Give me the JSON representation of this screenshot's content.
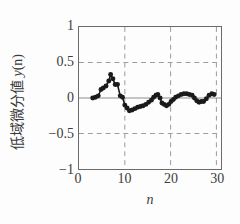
{
  "chart_data": {
    "type": "scatter",
    "title": "",
    "xlabel": "n",
    "ylabel": "低域微分値 y(n)",
    "ylabel_text": "低域微分値 ",
    "ylabel_italic": "y",
    "ylabel_paren": "(n)",
    "xlim": [
      0,
      31
    ],
    "ylim": [
      -1,
      1
    ],
    "xticks": [
      0,
      10,
      20,
      30
    ],
    "xtick_labels": [
      "0",
      "10",
      "20",
      "30"
    ],
    "yticks": [
      -1,
      -0.5,
      0,
      0.5,
      1
    ],
    "ytick_labels": [
      "−1",
      "−0.5",
      "0",
      "0.5",
      "1"
    ],
    "grid": true,
    "grid_style": "dashed",
    "zero_line": true,
    "legend": null,
    "marker": "filled-circle",
    "marker_color": "#1a1a1a",
    "line_color": "#1a1a1a",
    "x": [
      3,
      4,
      5,
      6,
      7,
      8,
      9,
      10,
      11,
      12,
      13,
      14,
      15,
      16,
      17,
      18,
      19,
      20,
      21,
      22,
      23,
      24,
      25,
      26,
      27,
      28,
      29
    ],
    "y": [
      0.0,
      0.02,
      0.13,
      0.17,
      0.33,
      0.2,
      0.02,
      -0.12,
      -0.18,
      -0.14,
      -0.11,
      -0.08,
      -0.05,
      0.02,
      0.05,
      -0.08,
      -0.11,
      -0.05,
      0.02,
      0.05,
      0.06,
      0.05,
      0.0,
      -0.06,
      -0.05,
      0.05,
      0.06
    ],
    "series": [
      {
        "name": "y(n)",
        "points": [
          {
            "x": 3,
            "y": 0.0
          },
          {
            "x": 3.6,
            "y": 0.01
          },
          {
            "x": 4.2,
            "y": 0.03
          },
          {
            "x": 4.8,
            "y": 0.12
          },
          {
            "x": 5.3,
            "y": 0.14
          },
          {
            "x": 5.9,
            "y": 0.17
          },
          {
            "x": 6.5,
            "y": 0.24
          },
          {
            "x": 6.9,
            "y": 0.33
          },
          {
            "x": 7.4,
            "y": 0.27
          },
          {
            "x": 7.9,
            "y": 0.19
          },
          {
            "x": 8.4,
            "y": 0.19
          },
          {
            "x": 9.0,
            "y": 0.03
          },
          {
            "x": 9.5,
            "y": 0.01
          },
          {
            "x": 10.0,
            "y": -0.1
          },
          {
            "x": 10.5,
            "y": -0.14
          },
          {
            "x": 11.0,
            "y": -0.18
          },
          {
            "x": 11.6,
            "y": -0.17
          },
          {
            "x": 12.2,
            "y": -0.15
          },
          {
            "x": 12.8,
            "y": -0.13
          },
          {
            "x": 13.4,
            "y": -0.12
          },
          {
            "x": 14.0,
            "y": -0.11
          },
          {
            "x": 14.6,
            "y": -0.09
          },
          {
            "x": 15.2,
            "y": -0.06
          },
          {
            "x": 15.8,
            "y": -0.03
          },
          {
            "x": 16.3,
            "y": 0.01
          },
          {
            "x": 16.8,
            "y": 0.04
          },
          {
            "x": 17.2,
            "y": 0.05
          },
          {
            "x": 17.7,
            "y": 0.0
          },
          {
            "x": 18.1,
            "y": -0.07
          },
          {
            "x": 18.6,
            "y": -0.09
          },
          {
            "x": 19.1,
            "y": -0.11
          },
          {
            "x": 19.6,
            "y": -0.09
          },
          {
            "x": 20.1,
            "y": -0.05
          },
          {
            "x": 20.6,
            "y": -0.02
          },
          {
            "x": 21.1,
            "y": 0.01
          },
          {
            "x": 21.7,
            "y": 0.03
          },
          {
            "x": 22.3,
            "y": 0.05
          },
          {
            "x": 22.9,
            "y": 0.06
          },
          {
            "x": 23.5,
            "y": 0.06
          },
          {
            "x": 24.1,
            "y": 0.05
          },
          {
            "x": 24.7,
            "y": 0.04
          },
          {
            "x": 25.2,
            "y": 0.0
          },
          {
            "x": 25.7,
            "y": -0.04
          },
          {
            "x": 26.2,
            "y": -0.06
          },
          {
            "x": 26.7,
            "y": -0.05
          },
          {
            "x": 27.2,
            "y": -0.05
          },
          {
            "x": 27.8,
            "y": -0.01
          },
          {
            "x": 28.4,
            "y": 0.04
          },
          {
            "x": 29.0,
            "y": 0.06
          },
          {
            "x": 29.5,
            "y": 0.05
          }
        ]
      }
    ]
  },
  "axes": {
    "y_label_full": "低域微分値 y(n)",
    "x_label": "n"
  }
}
